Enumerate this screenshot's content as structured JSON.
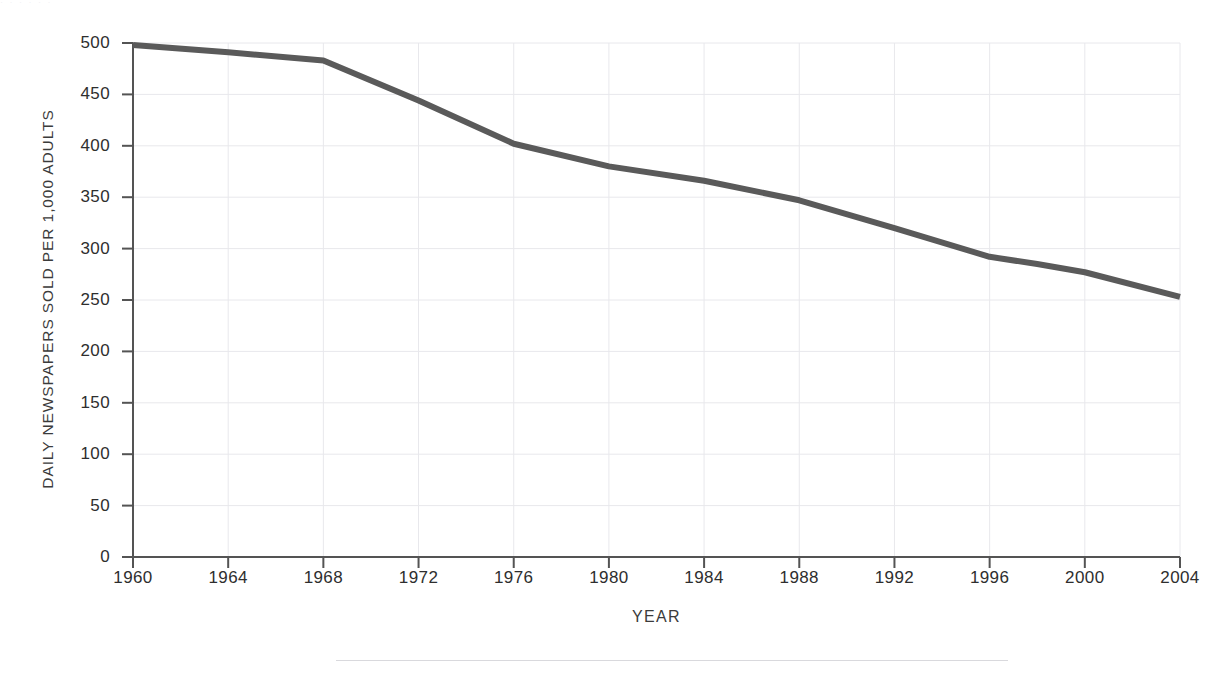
{
  "figure": {
    "top_caption_fragment": "· ·  ·   ·  · ·",
    "bottom_rule": "horizontal-rule"
  },
  "chart_data": {
    "type": "line",
    "title": "",
    "subtitle": "",
    "xlabel": "YEAR",
    "ylabel": "DAILY NEWSPAPERS SOLD PER 1,000 ADULTS",
    "xlim": [
      1960,
      2004
    ],
    "ylim": [
      0,
      500
    ],
    "xticks": [
      1960,
      1964,
      1968,
      1972,
      1976,
      1980,
      1984,
      1988,
      1992,
      1996,
      2000,
      2004
    ],
    "xtick_labels": [
      "1960",
      "1964",
      "1968",
      "1972",
      "1976",
      "1980",
      "1984",
      "1988",
      "1992",
      "1996",
      "2000",
      "2004"
    ],
    "yticks": [
      0,
      50,
      100,
      150,
      200,
      250,
      300,
      350,
      400,
      450,
      500
    ],
    "ytick_labels": [
      "0",
      "50",
      "100",
      "150",
      "200",
      "250",
      "300",
      "350",
      "400",
      "450",
      "500"
    ],
    "grid": true,
    "grid_color": "#e8e8ec",
    "legend": null,
    "line_color": "#5a5a5a",
    "line_width": 6,
    "axis_color": "#545454",
    "series": [
      {
        "name": "Daily newspapers sold per 1,000 adults",
        "x": [
          1960,
          1964,
          1968,
          1972,
          1976,
          1980,
          1984,
          1988,
          1992,
          1996,
          1998,
          2000,
          2004
        ],
        "values": [
          498,
          491,
          483,
          444,
          402,
          380,
          366,
          347,
          320,
          292,
          285,
          277,
          253
        ]
      }
    ]
  }
}
